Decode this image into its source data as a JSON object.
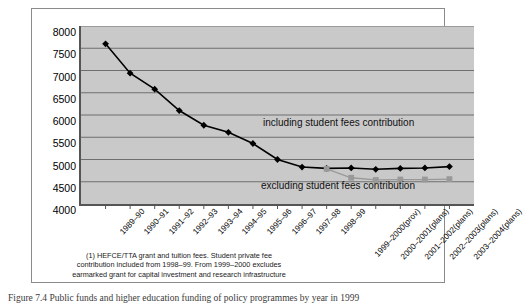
{
  "chart_data": {
    "type": "line",
    "title": "",
    "xlabel": "",
    "ylabel": "",
    "ylim": [
      4000,
      8000
    ],
    "ytick_step": 500,
    "yticks": [
      "4000",
      "4500",
      "5000",
      "5500",
      "6000",
      "6500",
      "7000",
      "7500",
      "8000"
    ],
    "grid": true,
    "legend_position": "inline-annotation",
    "categories": [
      "1989–90",
      "1990–91",
      "1991–92",
      "1992–93",
      "1993–94",
      "1994–95",
      "1995–96",
      "1996–97",
      "1997–98",
      "1998–99",
      "1999–2000(prov)",
      "2000–2001(plans)",
      "2001–2002(plans)",
      "2002–2003(plans)",
      "2003–2004(plans)"
    ],
    "series": [
      {
        "name": "including student fees contribution",
        "color": "#000000",
        "marker": "diamond",
        "values": [
          7600,
          6940,
          6580,
          6100,
          5770,
          5610,
          5360,
          5000,
          4830,
          4800,
          4810,
          4780,
          4800,
          4810,
          4840
        ]
      },
      {
        "name": "excluding student fees contribution",
        "color": "#999999",
        "marker": "square",
        "values": [
          null,
          null,
          null,
          null,
          null,
          null,
          null,
          null,
          null,
          4790,
          4590,
          4540,
          4550,
          4550,
          4560
        ]
      }
    ],
    "annotations": [
      "including student fees contribution",
      "excluding student fees contribution"
    ]
  },
  "footnote": {
    "text": "(1) HEFCE/TTA grant and tuition fees. Student private fee contribution included from 1998–99. From 1999–2000 excludes earmarked grant for capital investment and research infrastructure"
  },
  "caption": {
    "text": "Figure 7.4  Public funds and higher education funding of policy programmes by year in 1999"
  }
}
